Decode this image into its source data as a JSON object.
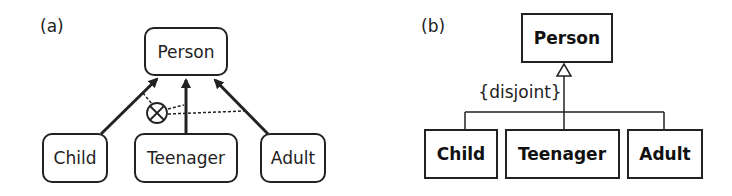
{
  "panel_a": {
    "label": "(a)",
    "superclass": "Person",
    "subclasses": [
      "Child",
      "Teenager",
      "Adult"
    ],
    "constraint_symbol": "disjoint-circle-x"
  },
  "panel_b": {
    "label": "(b)",
    "superclass": "Person",
    "subclasses": [
      "Child",
      "Teenager",
      "Adult"
    ],
    "constraint": "{disjoint}"
  },
  "colors": {
    "stroke": "#222222",
    "background": "#ffffff"
  }
}
